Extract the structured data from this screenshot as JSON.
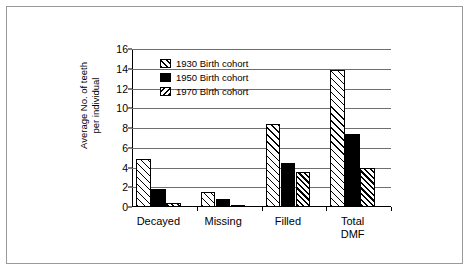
{
  "chart_data": {
    "type": "bar",
    "title": "",
    "subtitle": "",
    "xlabel": "",
    "ylabel": "Average No. of teeth per individual",
    "ylabel_line1": "Average No. of teeth",
    "ylabel_line2": "per individual",
    "categories": [
      "Decayed",
      "Missing",
      "Filled",
      "Total DMF"
    ],
    "category_lines": [
      [
        "Decayed"
      ],
      [
        "Missing"
      ],
      [
        "Filled"
      ],
      [
        "Total",
        "DMF"
      ]
    ],
    "series": [
      {
        "name": "1930 Birth cohort",
        "pattern": "diagonal-hatch-sparse",
        "values": [
          4.9,
          1.5,
          8.4,
          13.9
        ]
      },
      {
        "name": "1950 Birth cohort",
        "pattern": "solid-black",
        "values": [
          1.85,
          0.8,
          4.5,
          7.4
        ]
      },
      {
        "name": "1970 Birth cohort",
        "pattern": "diagonal-hatch-dense",
        "values": [
          0.4,
          0.1,
          3.55,
          4.0
        ]
      }
    ],
    "ylim": [
      0,
      16
    ],
    "ytick_step": 2,
    "yticks": [
      0,
      2,
      4,
      6,
      8,
      10,
      12,
      14,
      16
    ],
    "grid": true,
    "grid_axis": "y",
    "legend_position": "top-left-inside",
    "colors": {
      "axis": "#000000",
      "gridline": "#6e6e6e",
      "bar_outline": "#000000",
      "series_1950_fill": "#000000",
      "background": "#ffffff",
      "frame_border": "#9a9a9a"
    }
  }
}
